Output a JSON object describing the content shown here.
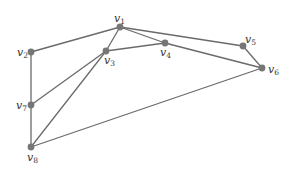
{
  "diagram": {
    "type": "graph",
    "colors": {
      "edge": "#6a6a6a",
      "node": "#767676",
      "label": "#333333"
    },
    "nodes": [
      {
        "id": "v1",
        "base": "v",
        "sub": "1",
        "x": 120,
        "y": 27,
        "lx": 114,
        "ly": 13
      },
      {
        "id": "v2",
        "base": "v",
        "sub": "2",
        "x": 31,
        "y": 52,
        "lx": 17,
        "ly": 47
      },
      {
        "id": "v3",
        "base": "v",
        "sub": "3",
        "x": 106,
        "y": 51,
        "lx": 104,
        "ly": 55
      },
      {
        "id": "v4",
        "base": "v",
        "sub": "4",
        "x": 165,
        "y": 43,
        "lx": 160,
        "ly": 47
      },
      {
        "id": "v5",
        "base": "v",
        "sub": "5",
        "x": 243,
        "y": 46,
        "lx": 245,
        "ly": 34
      },
      {
        "id": "v6",
        "base": "v",
        "sub": "6",
        "x": 262,
        "y": 68,
        "lx": 268,
        "ly": 64
      },
      {
        "id": "v7",
        "base": "v",
        "sub": "7",
        "x": 31,
        "y": 105,
        "lx": 16,
        "ly": 100
      },
      {
        "id": "v8",
        "base": "v",
        "sub": "8",
        "x": 31,
        "y": 147,
        "lx": 27,
        "ly": 152
      }
    ],
    "edges": [
      [
        "v1",
        "v2"
      ],
      [
        "v1",
        "v3"
      ],
      [
        "v1",
        "v4"
      ],
      [
        "v1",
        "v5"
      ],
      [
        "v3",
        "v4"
      ],
      [
        "v4",
        "v6"
      ],
      [
        "v5",
        "v6"
      ],
      [
        "v2",
        "v7"
      ],
      [
        "v7",
        "v8"
      ],
      [
        "v7",
        "v3"
      ],
      [
        "v8",
        "v3"
      ],
      [
        "v8",
        "v6"
      ]
    ]
  }
}
